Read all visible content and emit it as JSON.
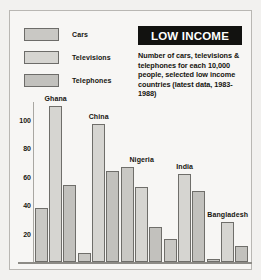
{
  "panel": {
    "title": "LOW INCOME",
    "description": "Number of cars, televisions & telephones for each 10,000 people, selected low income countries (latest data, 1983-1988)"
  },
  "legend": {
    "items": [
      {
        "label": "Cars",
        "color": "#c9c8c4"
      },
      {
        "label": "Televisions",
        "color": "#d6d5d1"
      },
      {
        "label": "Telephones",
        "color": "#c2c1bd"
      }
    ]
  },
  "colors": {
    "page_background": "#f2f1ef",
    "panel_background": "#f7f6f4",
    "frame_border": "#b9b7b3",
    "title_bar": "#121210",
    "title_text": "#ffffff",
    "text": "#16150f",
    "bar_outline": "#6f6e6a",
    "axis": "#8d8b86"
  },
  "chart_data": {
    "type": "bar",
    "title": "LOW INCOME",
    "subtitle": "Number of cars, televisions & telephones for each 10,000 people, selected low income countries (latest data, 1983-1988)",
    "xlabel": "",
    "ylabel": "",
    "ylim": [
      0,
      110
    ],
    "yticks": [
      20,
      40,
      60,
      80,
      100
    ],
    "grid": false,
    "legend_position": "top-left",
    "categories": [
      "Ghana",
      "China",
      "Nigeria",
      "India",
      "Bangladesh"
    ],
    "series": [
      {
        "name": "Cars",
        "values": [
          38,
          6,
          67,
          16,
          2
        ]
      },
      {
        "name": "Televisions",
        "values": [
          110,
          97,
          53,
          62,
          28
        ]
      },
      {
        "name": "Telephones",
        "values": [
          54,
          64,
          25,
          50,
          11
        ]
      }
    ]
  }
}
